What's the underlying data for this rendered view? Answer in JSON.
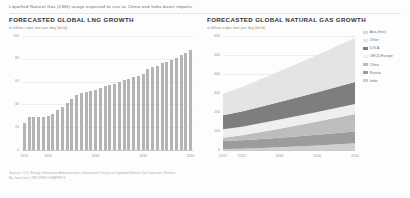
{
  "headline": "Liquefied Natural Gas (LNG) usage expected to rise as China and India boost imports",
  "left_panel": {
    "title": "FORECASTED GLOBAL LNG GROWTH",
    "subtitle": "in billion cubic feet per day (bcfd)"
  },
  "right_panel": {
    "title": "FORECASTED GLOBAL NATURAL GAS GROWTH",
    "subtitle": "in billion cubic feet per day (bcfd)"
  },
  "sources": [
    "Sources: U.S. Energy Information Administration, International Group on Liquefied Natural Gas Importers, Reuters",
    "By Jason Lee | REUTERS GRAPHICS"
  ],
  "chart_data": [
    {
      "type": "bar",
      "title": "FORECASTED GLOBAL LNG GROWTH",
      "subtitle": "in billion cubic feet per day (bcfd)",
      "xlabel": "",
      "ylabel": "bcfd",
      "ylim": [
        0,
        100
      ],
      "yticks": [
        0,
        20,
        40,
        60,
        80,
        100
      ],
      "xticks": [
        2015,
        2020,
        2030,
        2040,
        2050
      ],
      "grid": false,
      "bar_color": "#b4b4b4",
      "categories": [
        2015,
        2016,
        2017,
        2018,
        2019,
        2020,
        2021,
        2022,
        2023,
        2024,
        2025,
        2026,
        2027,
        2028,
        2029,
        2030,
        2031,
        2032,
        2033,
        2034,
        2035,
        2036,
        2037,
        2038,
        2039,
        2040,
        2041,
        2042,
        2043,
        2044,
        2045,
        2046,
        2047,
        2048,
        2049,
        2050
      ],
      "values": [
        24,
        29,
        29,
        29,
        29,
        30,
        32,
        35,
        38,
        41,
        45,
        48,
        50,
        51,
        52,
        53,
        54,
        56,
        57,
        58,
        60,
        61,
        62,
        64,
        65,
        67,
        71,
        73,
        74,
        76,
        77,
        79,
        81,
        83,
        85,
        88
      ]
    },
    {
      "type": "area",
      "title": "FORECASTED GLOBAL NATURAL GAS GROWTH",
      "subtitle": "in billion cubic feet per day (bcfd)",
      "xlabel": "",
      "ylabel": "bcfd",
      "ylim": [
        0,
        600
      ],
      "yticks": [
        0,
        100,
        200,
        300,
        400,
        500,
        600
      ],
      "xticks": [
        2015,
        2020,
        2030,
        2040,
        2050
      ],
      "grid": false,
      "legend_position": "right",
      "x": [
        2015,
        2020,
        2030,
        2040,
        2050
      ],
      "series": [
        {
          "name": "India",
          "color": "#cfcfcf",
          "values": [
            5,
            7,
            14,
            24,
            36
          ]
        },
        {
          "name": "Russia",
          "color": "#9c9c9c",
          "values": [
            42,
            44,
            50,
            56,
            62
          ]
        },
        {
          "name": "China",
          "color": "#bdbdbd",
          "values": [
            18,
            27,
            48,
            70,
            92
          ]
        },
        {
          "name": "OECD Europe",
          "color": "#efefef",
          "values": [
            44,
            45,
            48,
            50,
            52
          ]
        },
        {
          "name": "U.S.A.",
          "color": "#7e7e7e",
          "values": [
            74,
            80,
            92,
            104,
            116
          ]
        },
        {
          "name": "Other",
          "color": "#e4e4e4",
          "values": [
            113,
            127,
            163,
            196,
            232
          ]
        }
      ],
      "legend": [
        {
          "label": "Asia (mix)",
          "color": "#d9d9d9"
        },
        {
          "label": "Other",
          "color": "#e4e4e4"
        },
        {
          "label": "U.S.A.",
          "color": "#7e7e7e"
        },
        {
          "label": "OECD Europe",
          "color": "#efefef"
        },
        {
          "label": "China",
          "color": "#bdbdbd"
        },
        {
          "label": "Russia",
          "color": "#9c9c9c"
        },
        {
          "label": "India",
          "color": "#cfcfcf"
        }
      ]
    }
  ]
}
